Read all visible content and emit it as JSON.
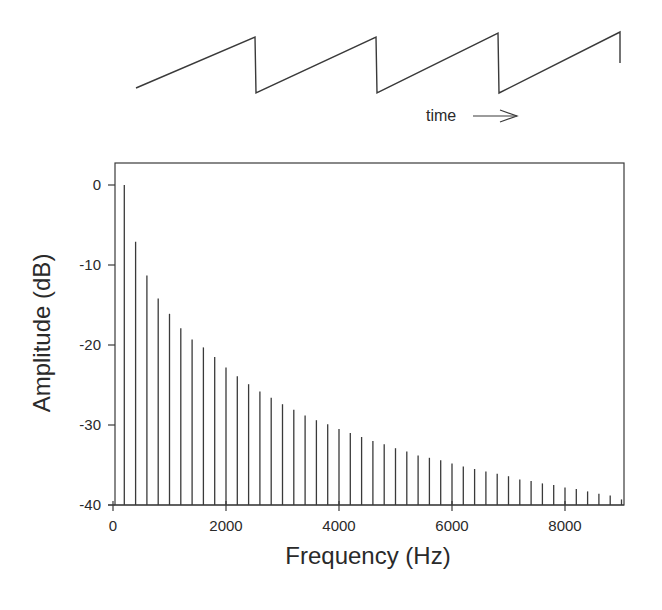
{
  "waveform": {
    "type": "sawtooth",
    "label": "time",
    "arrow": "→",
    "points": [
      [
        136,
        88
      ],
      [
        255,
        37
      ],
      [
        256,
        93
      ],
      [
        376,
        37
      ],
      [
        377,
        93
      ],
      [
        498,
        33
      ],
      [
        499,
        93
      ],
      [
        620,
        32
      ],
      [
        620,
        63
      ]
    ]
  },
  "chart_data": {
    "type": "bar",
    "subtype": "line spectrum (stem)",
    "title": "",
    "xlabel": "Frequency (Hz)",
    "ylabel": "Amplitude (dB)",
    "xlim": [
      0,
      9000
    ],
    "ylim": [
      -40,
      3
    ],
    "xticks": [
      0,
      2000,
      4000,
      6000,
      8000
    ],
    "xtick_labels": [
      "0",
      "2000",
      "4000",
      "6000",
      "8000"
    ],
    "yticks": [
      0,
      -10,
      -20,
      -30,
      -40
    ],
    "ytick_labels": [
      "0",
      "-10",
      "-20",
      "-30",
      "-40"
    ],
    "grid": false,
    "legend": null,
    "fundamental_hz": 200,
    "x": [
      200,
      400,
      600,
      800,
      1000,
      1200,
      1400,
      1600,
      1800,
      2000,
      2200,
      2400,
      2600,
      2800,
      3000,
      3200,
      3400,
      3600,
      3800,
      4000,
      4200,
      4400,
      4600,
      4800,
      5000,
      5200,
      5400,
      5600,
      5800,
      6000,
      6200,
      6400,
      6600,
      6800,
      7000,
      7200,
      7400,
      7600,
      7800,
      8000,
      8200,
      8400,
      8600,
      8800,
      9000
    ],
    "values": [
      0,
      -7.1,
      -11.3,
      -14.2,
      -16.1,
      -17.9,
      -19.3,
      -20.3,
      -21.5,
      -22.8,
      -23.9,
      -24.9,
      -25.8,
      -26.6,
      -27.4,
      -28.1,
      -28.8,
      -29.4,
      -29.9,
      -30.5,
      -31.0,
      -31.5,
      -32.0,
      -32.4,
      -32.9,
      -33.3,
      -33.8,
      -34.1,
      -34.4,
      -34.8,
      -35.2,
      -35.5,
      -35.8,
      -36.1,
      -36.4,
      -36.8,
      -37.0,
      -37.3,
      -37.5,
      -37.8,
      -38.0,
      -38.3,
      -38.6,
      -38.8,
      -39.3
    ]
  },
  "colors": {
    "ink": "#3a3a3a",
    "background": "#ffffff"
  }
}
